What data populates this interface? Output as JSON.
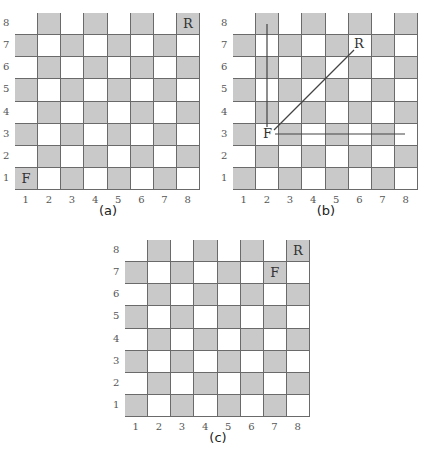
{
  "figure": {
    "boards": [
      {
        "id": "a",
        "caption": "(a)",
        "row_labels": [
          "8",
          "7",
          "6",
          "5",
          "4",
          "3",
          "2",
          "1"
        ],
        "col_labels": [
          "1",
          "2",
          "3",
          "4",
          "5",
          "6",
          "7",
          "8"
        ],
        "pieces": [
          {
            "label": "F",
            "col": 1,
            "row": 1
          },
          {
            "label": "R",
            "col": 8,
            "row": 8
          }
        ],
        "lines": []
      },
      {
        "id": "b",
        "caption": "(b)",
        "row_labels": [
          "8",
          "7",
          "6",
          "5",
          "4",
          "3",
          "2",
          "1"
        ],
        "col_labels": [
          "1",
          "2",
          "3",
          "4",
          "5",
          "6",
          "7",
          "8"
        ],
        "pieces": [
          {
            "label": "F",
            "col": 2,
            "row": 3
          },
          {
            "label": "R",
            "col": 6.5,
            "row": 7.3
          }
        ],
        "lines": [
          {
            "name": "vertical-move-line",
            "from": "F (2,3)",
            "to": "(2,8)"
          },
          {
            "name": "diagonal-move-line",
            "from": "F (2,3)",
            "to": "R (6.5,7.3)"
          },
          {
            "name": "horizontal-move-line",
            "from": "F (2,3)",
            "to": "(8,3)"
          }
        ]
      },
      {
        "id": "c",
        "caption": "(c)",
        "row_labels": [
          "8",
          "7",
          "6",
          "5",
          "4",
          "3",
          "2",
          "1"
        ],
        "col_labels": [
          "1",
          "2",
          "3",
          "4",
          "5",
          "6",
          "7",
          "8"
        ],
        "pieces": [
          {
            "label": "F",
            "col": 7,
            "row": 7
          },
          {
            "label": "R",
            "col": 8,
            "row": 8
          }
        ],
        "lines": []
      }
    ],
    "colors": {
      "dark_square": "#c9c9c9",
      "light_square": "#ffffff",
      "grid_line": "#555555",
      "move_line": "#444444"
    }
  }
}
